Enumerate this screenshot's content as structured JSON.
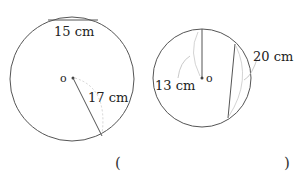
{
  "figure": {
    "circles": [
      {
        "id": "left",
        "chord_label": "15 cm",
        "radius_label": "17 cm",
        "center_label": "o"
      },
      {
        "id": "right",
        "radius_label": "13 cm",
        "chord_label": "20 cm",
        "center_label": "o"
      }
    ],
    "answer": {
      "open": "(",
      "close": ")"
    }
  }
}
